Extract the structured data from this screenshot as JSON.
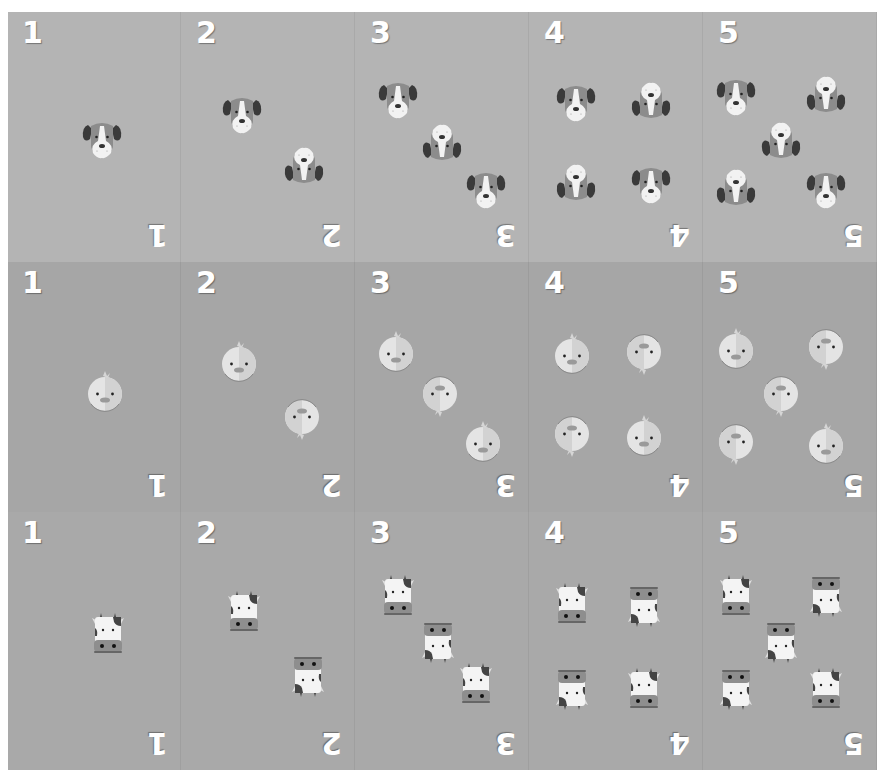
{
  "colors": {
    "strip_dog": "#b4b4b4",
    "strip_chick": "#a6a6a6",
    "strip_cow": "#a9a9a9",
    "number_text": "#ffffff"
  },
  "strips": [
    {
      "animal": "dog",
      "icon": "dog-icon",
      "cards": [
        {
          "label": "1",
          "icons": [
            {
              "x": 72,
              "y": 105,
              "flip": false
            }
          ]
        },
        {
          "label": "2",
          "icons": [
            {
              "x": 38,
              "y": 80,
              "flip": false
            },
            {
              "x": 100,
              "y": 133,
              "flip": true
            }
          ]
        },
        {
          "label": "3",
          "icons": [
            {
              "x": 20,
              "y": 65,
              "flip": false
            },
            {
              "x": 64,
              "y": 110,
              "flip": true
            },
            {
              "x": 108,
              "y": 155,
              "flip": false
            }
          ]
        },
        {
          "label": "4",
          "icons": [
            {
              "x": 24,
              "y": 68,
              "flip": false
            },
            {
              "x": 99,
              "y": 68,
              "flip": true
            },
            {
              "x": 24,
              "y": 150,
              "flip": true
            },
            {
              "x": 99,
              "y": 150,
              "flip": false
            }
          ]
        },
        {
          "label": "5",
          "icons": [
            {
              "x": 10,
              "y": 62,
              "flip": false
            },
            {
              "x": 100,
              "y": 62,
              "flip": true
            },
            {
              "x": 55,
              "y": 108,
              "flip": true
            },
            {
              "x": 10,
              "y": 155,
              "flip": true
            },
            {
              "x": 100,
              "y": 155,
              "flip": false
            }
          ]
        }
      ]
    },
    {
      "animal": "chick",
      "icon": "chick-icon",
      "cards": [
        {
          "label": "1",
          "icons": [
            {
              "x": 75,
              "y": 108,
              "flip": false
            }
          ]
        },
        {
          "label": "2",
          "icons": [
            {
              "x": 35,
              "y": 78,
              "flip": false
            },
            {
              "x": 98,
              "y": 135,
              "flip": true
            }
          ]
        },
        {
          "label": "3",
          "icons": [
            {
              "x": 18,
              "y": 68,
              "flip": false
            },
            {
              "x": 62,
              "y": 112,
              "flip": true
            },
            {
              "x": 105,
              "y": 158,
              "flip": false
            }
          ]
        },
        {
          "label": "4",
          "icons": [
            {
              "x": 20,
              "y": 70,
              "flip": false
            },
            {
              "x": 92,
              "y": 70,
              "flip": true
            },
            {
              "x": 20,
              "y": 152,
              "flip": true
            },
            {
              "x": 92,
              "y": 152,
              "flip": false
            }
          ]
        },
        {
          "label": "5",
          "icons": [
            {
              "x": 10,
              "y": 65,
              "flip": false
            },
            {
              "x": 100,
              "y": 65,
              "flip": true
            },
            {
              "x": 55,
              "y": 112,
              "flip": true
            },
            {
              "x": 10,
              "y": 160,
              "flip": true
            },
            {
              "x": 100,
              "y": 160,
              "flip": false
            }
          ]
        }
      ]
    },
    {
      "animal": "cow",
      "icon": "cow-icon",
      "cards": [
        {
          "label": "1",
          "icons": [
            {
              "x": 78,
              "y": 100,
              "flip": false
            }
          ]
        },
        {
          "label": "2",
          "icons": [
            {
              "x": 40,
              "y": 78,
              "flip": false
            },
            {
              "x": 104,
              "y": 142,
              "flip": true
            }
          ]
        },
        {
          "label": "3",
          "icons": [
            {
              "x": 20,
              "y": 62,
              "flip": false
            },
            {
              "x": 60,
              "y": 108,
              "flip": true
            },
            {
              "x": 98,
              "y": 150,
              "flip": false
            }
          ]
        },
        {
          "label": "4",
          "icons": [
            {
              "x": 20,
              "y": 70,
              "flip": false
            },
            {
              "x": 92,
              "y": 72,
              "flip": true
            },
            {
              "x": 20,
              "y": 155,
              "flip": true
            },
            {
              "x": 92,
              "y": 155,
              "flip": false
            }
          ]
        },
        {
          "label": "5",
          "icons": [
            {
              "x": 10,
              "y": 62,
              "flip": false
            },
            {
              "x": 100,
              "y": 62,
              "flip": true
            },
            {
              "x": 55,
              "y": 108,
              "flip": true
            },
            {
              "x": 10,
              "y": 155,
              "flip": true
            },
            {
              "x": 100,
              "y": 155,
              "flip": false
            }
          ]
        }
      ]
    }
  ]
}
